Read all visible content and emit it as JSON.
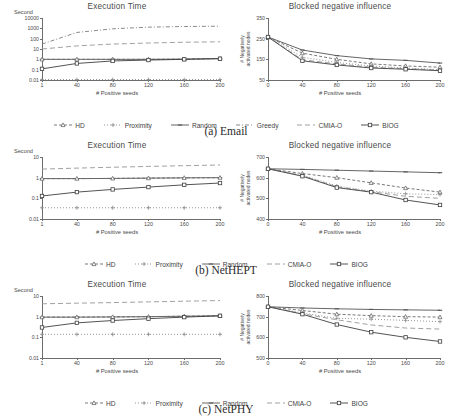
{
  "figure": {
    "xlabel": "# Positive seeds",
    "time_title": "Execution Time",
    "time_unit": "Second",
    "infl_title": "Blocked negative influence",
    "infl_ylabel_line1": "# Negatively",
    "infl_ylabel_line2": "activated nodes",
    "xticks": [
      "1",
      "40",
      "80",
      "120",
      "160",
      "200"
    ],
    "xticks_infl": [
      "0",
      "40",
      "80",
      "120",
      "160",
      "200"
    ]
  },
  "panels": [
    {
      "caption": "(a) Email",
      "legend": [
        {
          "label": "HD",
          "color": "#6a6a6a",
          "dash": "3,2",
          "marker": "triangle"
        },
        {
          "label": "Proximity",
          "color": "#8a8a8a",
          "dash": "1,2",
          "marker": "plus"
        },
        {
          "label": "Random",
          "color": "#555555",
          "dash": "0",
          "marker": "dash"
        },
        {
          "label": "Greedy",
          "color": "#7d7d7d",
          "dash": "4,2,1,2",
          "marker": "none"
        },
        {
          "label": "CMIA-O",
          "color": "#959595",
          "dash": "5,3",
          "marker": "none"
        },
        {
          "label": "BIOG",
          "color": "#3f3f3f",
          "dash": "0",
          "marker": "square"
        }
      ]
    },
    {
      "caption": "(b) NetHEPT",
      "legend": [
        {
          "label": "HD",
          "color": "#6a6a6a",
          "dash": "3,2",
          "marker": "triangle"
        },
        {
          "label": "Proximity",
          "color": "#8a8a8a",
          "dash": "1,2",
          "marker": "plus"
        },
        {
          "label": "Random",
          "color": "#555555",
          "dash": "0",
          "marker": "dash"
        },
        {
          "label": "CMIA-O",
          "color": "#959595",
          "dash": "5,3",
          "marker": "none"
        },
        {
          "label": "BIOG",
          "color": "#3f3f3f",
          "dash": "0",
          "marker": "square"
        }
      ]
    },
    {
      "caption": "(c) NetPHY",
      "legend": [
        {
          "label": "HD",
          "color": "#6a6a6a",
          "dash": "3,2",
          "marker": "triangle"
        },
        {
          "label": "Proximity",
          "color": "#8a8a8a",
          "dash": "1,2",
          "marker": "plus"
        },
        {
          "label": "Random",
          "color": "#555555",
          "dash": "0",
          "marker": "dash"
        },
        {
          "label": "CMIA-O",
          "color": "#959595",
          "dash": "5,3",
          "marker": "none"
        },
        {
          "label": "BIOG",
          "color": "#3f3f3f",
          "dash": "0",
          "marker": "square"
        }
      ]
    }
  ],
  "chart_data": [
    {
      "id": "a-time",
      "type": "line",
      "panel": "(a) Email",
      "title": "Execution Time",
      "xlabel": "# Positive seeds",
      "ylabel": "Second",
      "yscale": "log",
      "ylim": [
        0.01,
        10000
      ],
      "yticks": [
        0.01,
        0.1,
        1,
        10,
        100,
        1000,
        10000
      ],
      "ytick_labels": [
        "0.01",
        "0.1",
        "1",
        "10",
        "100",
        "1000",
        "10000"
      ],
      "x": [
        1,
        40,
        80,
        120,
        160,
        200
      ],
      "xlim": [
        1,
        200
      ],
      "grid": false,
      "legend_position": "below",
      "series": [
        {
          "name": "Greedy",
          "values": [
            30,
            400,
            900,
            1300,
            1500,
            1600
          ]
        },
        {
          "name": "CMIA-O",
          "values": [
            10,
            20,
            30,
            38,
            45,
            50
          ]
        },
        {
          "name": "Random",
          "values": [
            1.0,
            1.0,
            1.0,
            1.0,
            1.05,
            1.2
          ]
        },
        {
          "name": "HD",
          "values": [
            1.0,
            1.0,
            1.0,
            1.0,
            1.05,
            1.2
          ]
        },
        {
          "name": "BIOG",
          "values": [
            0.12,
            0.4,
            0.7,
            0.85,
            1.0,
            1.15
          ]
        },
        {
          "name": "Proximity",
          "values": [
            0.011,
            0.011,
            0.011,
            0.011,
            0.011,
            0.011
          ]
        }
      ]
    },
    {
      "id": "a-influence",
      "type": "line",
      "panel": "(a) Email",
      "title": "Blocked negative influence",
      "xlabel": "# Positive seeds",
      "ylabel": "# Negatively activated nodes",
      "yscale": "linear",
      "ylim": [
        50,
        350
      ],
      "yticks": [
        50,
        150,
        250,
        350
      ],
      "ytick_labels": [
        "50",
        "150",
        "250",
        "350"
      ],
      "x": [
        0,
        40,
        80,
        120,
        160,
        200
      ],
      "xlim": [
        0,
        200
      ],
      "grid": false,
      "legend_position": "below",
      "series": [
        {
          "name": "Random",
          "values": [
            258,
            195,
            168,
            152,
            145,
            132
          ]
        },
        {
          "name": "HD",
          "values": [
            258,
            180,
            150,
            128,
            118,
            112
          ]
        },
        {
          "name": "Proximity",
          "values": [
            258,
            160,
            135,
            118,
            108,
            100
          ]
        },
        {
          "name": "CMIA-O",
          "values": [
            258,
            148,
            128,
            112,
            105,
            98
          ]
        },
        {
          "name": "BIOG",
          "values": [
            258,
            143,
            123,
            108,
            102,
            95
          ]
        }
      ]
    },
    {
      "id": "b-time",
      "type": "line",
      "panel": "(b) NetHEPT",
      "title": "Execution Time",
      "xlabel": "# Positive seeds",
      "ylabel": "Second",
      "yscale": "log",
      "ylim": [
        0.01,
        10
      ],
      "yticks": [
        0.01,
        0.1,
        1,
        10
      ],
      "ytick_labels": [
        "0.01",
        "0.1",
        "1",
        "10"
      ],
      "x": [
        1,
        40,
        80,
        120,
        160,
        200
      ],
      "xlim": [
        1,
        200
      ],
      "grid": false,
      "legend_position": "below",
      "series": [
        {
          "name": "CMIA-O",
          "values": [
            2.6,
            2.9,
            3.2,
            3.5,
            3.8,
            4.1
          ]
        },
        {
          "name": "Random",
          "values": [
            0.9,
            0.9,
            0.92,
            0.95,
            0.98,
            1.0
          ]
        },
        {
          "name": "HD",
          "values": [
            0.9,
            0.9,
            0.92,
            0.95,
            0.98,
            1.0
          ]
        },
        {
          "name": "BIOG",
          "values": [
            0.13,
            0.2,
            0.27,
            0.35,
            0.45,
            0.55
          ]
        },
        {
          "name": "Proximity",
          "values": [
            0.035,
            0.035,
            0.035,
            0.035,
            0.035,
            0.035
          ]
        }
      ]
    },
    {
      "id": "b-influence",
      "type": "line",
      "panel": "(b) NetHEPT",
      "title": "Blocked negative influence",
      "xlabel": "# Positive seeds",
      "ylabel": "# Negatively activated nodes",
      "yscale": "linear",
      "ylim": [
        400,
        700
      ],
      "yticks": [
        400,
        500,
        600,
        700
      ],
      "ytick_labels": [
        "400",
        "500",
        "600",
        "700"
      ],
      "x": [
        0,
        40,
        80,
        120,
        160,
        200
      ],
      "xlim": [
        0,
        200
      ],
      "grid": false,
      "legend_position": "below",
      "series": [
        {
          "name": "Random",
          "values": [
            643,
            640,
            636,
            632,
            628,
            624
          ]
        },
        {
          "name": "HD",
          "values": [
            643,
            620,
            600,
            575,
            550,
            530
          ]
        },
        {
          "name": "Proximity",
          "values": [
            643,
            612,
            560,
            535,
            522,
            518
          ]
        },
        {
          "name": "CMIA-O",
          "values": [
            643,
            610,
            556,
            532,
            510,
            500
          ]
        },
        {
          "name": "BIOG",
          "values": [
            643,
            607,
            552,
            530,
            492,
            468
          ]
        }
      ]
    },
    {
      "id": "c-time",
      "type": "line",
      "panel": "(c) NetPHY",
      "title": "Execution Time",
      "xlabel": "# Positive seeds",
      "ylabel": "Second",
      "yscale": "log",
      "ylim": [
        0.01,
        10
      ],
      "yticks": [
        0.01,
        0.1,
        1,
        10
      ],
      "ytick_labels": [
        "0.01",
        "0.1",
        "1",
        "10"
      ],
      "x": [
        1,
        40,
        80,
        120,
        160,
        200
      ],
      "xlim": [
        1,
        200
      ],
      "grid": false,
      "legend_position": "below",
      "series": [
        {
          "name": "CMIA-O",
          "values": [
            4.2,
            4.5,
            4.8,
            5.2,
            5.6,
            6.0
          ]
        },
        {
          "name": "Random",
          "values": [
            0.95,
            0.95,
            0.97,
            1.0,
            1.05,
            1.1
          ]
        },
        {
          "name": "HD",
          "values": [
            0.95,
            0.95,
            0.97,
            1.0,
            1.05,
            1.1
          ]
        },
        {
          "name": "BIOG",
          "values": [
            0.3,
            0.5,
            0.65,
            0.8,
            0.95,
            1.1
          ]
        },
        {
          "name": "Proximity",
          "values": [
            0.14,
            0.14,
            0.14,
            0.14,
            0.14,
            0.14
          ]
        }
      ]
    },
    {
      "id": "c-influence",
      "type": "line",
      "panel": "(c) NetPHY",
      "title": "Blocked negative influence",
      "xlabel": "# Positive seeds",
      "ylabel": "# Negatively activated nodes",
      "yscale": "linear",
      "ylim": [
        500,
        800
      ],
      "yticks": [
        500,
        600,
        700,
        800
      ],
      "ytick_labels": [
        "500",
        "600",
        "700",
        "800"
      ],
      "x": [
        0,
        40,
        80,
        120,
        160,
        200
      ],
      "xlim": [
        0,
        200
      ],
      "grid": false,
      "legend_position": "below",
      "series": [
        {
          "name": "Random",
          "values": [
            748,
            742,
            738,
            735,
            733,
            731
          ]
        },
        {
          "name": "HD",
          "values": [
            748,
            730,
            712,
            705,
            700,
            698
          ]
        },
        {
          "name": "Proximity",
          "values": [
            748,
            718,
            692,
            688,
            682,
            676
          ]
        },
        {
          "name": "CMIA-O",
          "values": [
            748,
            714,
            685,
            660,
            645,
            640
          ]
        },
        {
          "name": "BIOG",
          "values": [
            748,
            712,
            662,
            625,
            600,
            580
          ]
        }
      ]
    }
  ]
}
